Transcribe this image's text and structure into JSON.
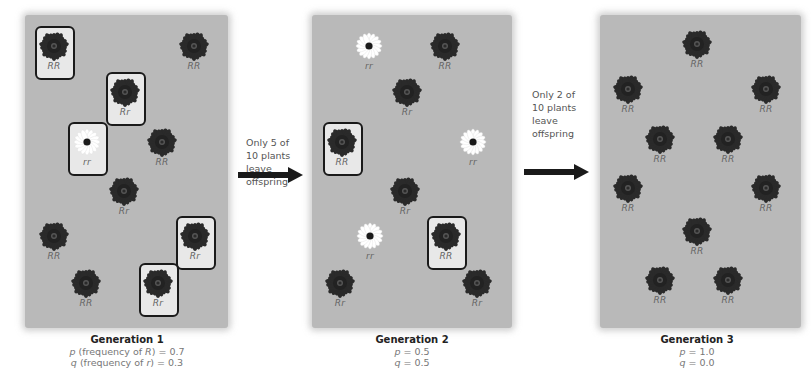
{
  "colors": {
    "panel_bg": "#b9b9b9",
    "red_flower": "#2a2a2a",
    "white_flower": "#ffffff",
    "box_border": "#1a1a1a",
    "arrow": "#1a1a1a"
  },
  "generations": [
    {
      "title": "Generation 1",
      "line_p": {
        "symbol": "p",
        "text_a": " (frequency of ",
        "allele": "R",
        "text_b": ") = 0.7"
      },
      "line_q": {
        "symbol": "q",
        "text_a": " (frequency of ",
        "allele": "r",
        "text_b": ") = 0.3"
      },
      "plants": [
        {
          "genotype": "RR",
          "color": "red",
          "boxed": true,
          "x": 54,
          "y": 50
        },
        {
          "genotype": "RR",
          "color": "red",
          "boxed": false,
          "x": 194,
          "y": 50
        },
        {
          "genotype": "Rr",
          "color": "red",
          "boxed": true,
          "x": 125,
          "y": 96
        },
        {
          "genotype": "rr",
          "color": "white",
          "boxed": true,
          "x": 87,
          "y": 146
        },
        {
          "genotype": "RR",
          "color": "red",
          "boxed": false,
          "x": 162,
          "y": 146
        },
        {
          "genotype": "Rr",
          "color": "red",
          "boxed": false,
          "x": 124,
          "y": 195
        },
        {
          "genotype": "RR",
          "color": "red",
          "boxed": false,
          "x": 54,
          "y": 240
        },
        {
          "genotype": "Rr",
          "color": "red",
          "boxed": true,
          "x": 195,
          "y": 240
        },
        {
          "genotype": "RR",
          "color": "red",
          "boxed": false,
          "x": 86,
          "y": 287
        },
        {
          "genotype": "Rr",
          "color": "red",
          "boxed": true,
          "x": 158,
          "y": 287
        }
      ]
    },
    {
      "title": "Generation 2",
      "line_p": {
        "symbol": "p",
        "text_a": " = 0.5",
        "allele": "",
        "text_b": ""
      },
      "line_q": {
        "symbol": "q",
        "text_a": " = 0.5",
        "allele": "",
        "text_b": ""
      },
      "plants": [
        {
          "genotype": "rr",
          "color": "white",
          "boxed": false,
          "x": 369,
          "y": 50
        },
        {
          "genotype": "RR",
          "color": "red",
          "boxed": false,
          "x": 445,
          "y": 50
        },
        {
          "genotype": "Rr",
          "color": "red",
          "boxed": false,
          "x": 407,
          "y": 96
        },
        {
          "genotype": "RR",
          "color": "red",
          "boxed": true,
          "x": 342,
          "y": 146
        },
        {
          "genotype": "rr",
          "color": "white",
          "boxed": false,
          "x": 473,
          "y": 146
        },
        {
          "genotype": "Rr",
          "color": "red",
          "boxed": false,
          "x": 405,
          "y": 195
        },
        {
          "genotype": "rr",
          "color": "white",
          "boxed": false,
          "x": 370,
          "y": 240
        },
        {
          "genotype": "RR",
          "color": "red",
          "boxed": true,
          "x": 446,
          "y": 240
        },
        {
          "genotype": "Rr",
          "color": "red",
          "boxed": false,
          "x": 340,
          "y": 287
        },
        {
          "genotype": "Rr",
          "color": "red",
          "boxed": false,
          "x": 477,
          "y": 287
        }
      ]
    },
    {
      "title": "Generation 3",
      "line_p": {
        "symbol": "p",
        "text_a": " = 1.0",
        "allele": "",
        "text_b": ""
      },
      "line_q": {
        "symbol": "q",
        "text_a": " = 0.0",
        "allele": "",
        "text_b": ""
      },
      "plants": [
        {
          "genotype": "RR",
          "color": "red",
          "boxed": false,
          "x": 697,
          "y": 48
        },
        {
          "genotype": "RR",
          "color": "red",
          "boxed": false,
          "x": 628,
          "y": 93
        },
        {
          "genotype": "RR",
          "color": "red",
          "boxed": false,
          "x": 766,
          "y": 93
        },
        {
          "genotype": "RR",
          "color": "red",
          "boxed": false,
          "x": 660,
          "y": 143
        },
        {
          "genotype": "RR",
          "color": "red",
          "boxed": false,
          "x": 728,
          "y": 143
        },
        {
          "genotype": "RR",
          "color": "red",
          "boxed": false,
          "x": 628,
          "y": 192
        },
        {
          "genotype": "RR",
          "color": "red",
          "boxed": false,
          "x": 766,
          "y": 192
        },
        {
          "genotype": "RR",
          "color": "red",
          "boxed": false,
          "x": 697,
          "y": 235
        },
        {
          "genotype": "RR",
          "color": "red",
          "boxed": false,
          "x": 660,
          "y": 284
        },
        {
          "genotype": "RR",
          "color": "red",
          "boxed": false,
          "x": 728,
          "y": 284
        }
      ]
    }
  ],
  "transitions": [
    {
      "text": "Only 5 of\n10 plants\nleave\noffspring",
      "icon": "right-arrow-icon"
    },
    {
      "text": "Only 2 of\n10 plants\nleave\noffspring",
      "icon": "right-arrow-icon"
    }
  ]
}
